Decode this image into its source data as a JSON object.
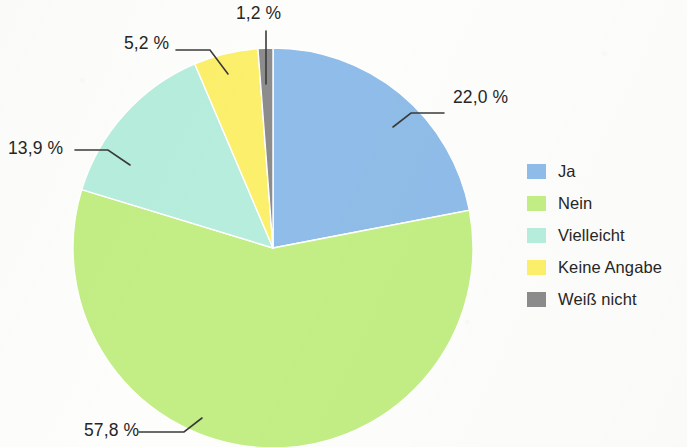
{
  "chart_data": {
    "type": "pie",
    "title": "",
    "subtitle": "",
    "xlabel": "",
    "ylabel": "",
    "legend_position": "right",
    "grid": false,
    "start_angle_deg": 0,
    "direction": "clockwise",
    "categories": [
      "Ja",
      "Nein",
      "Vielleicht",
      "Keine Angabe",
      "Weiß nicht"
    ],
    "values": [
      22.0,
      57.8,
      13.9,
      5.2,
      1.2
    ],
    "value_labels": [
      "22,0 %",
      "57,8 %",
      "13,9 %",
      "5,2 %",
      "1,2 %"
    ],
    "colors": [
      "#8FBCE8",
      "#C3EE85",
      "#B6EDDC",
      "#FCEF6B",
      "#8C8C8C"
    ],
    "unit": "%",
    "slices": [
      {
        "label": "Ja",
        "value": 22.0,
        "value_label": "22,0 %",
        "color": "#8FBCE8"
      },
      {
        "label": "Nein",
        "value": 57.8,
        "value_label": "57,8 %",
        "color": "#C3EE85"
      },
      {
        "label": "Vielleicht",
        "value": 13.9,
        "value_label": "13,9 %",
        "color": "#B6EDDC"
      },
      {
        "label": "Keine Angabe",
        "value": 5.2,
        "value_label": "5,2 %",
        "color": "#FCEF6B"
      },
      {
        "label": "Weiß nicht",
        "value": 1.2,
        "value_label": "1,2 %",
        "color": "#8C8C8C"
      }
    ]
  },
  "legend": {
    "items": [
      {
        "label": "Ja",
        "color": "#8FBCE8"
      },
      {
        "label": "Nein",
        "color": "#C3EE85"
      },
      {
        "label": "Vielleicht",
        "color": "#B6EDDC"
      },
      {
        "label": "Keine Angabe",
        "color": "#FCEF6B"
      },
      {
        "label": "Weiß nicht",
        "color": "#8C8C8C"
      }
    ]
  },
  "callouts": [
    {
      "text": "22,0 %",
      "slice": "Ja"
    },
    {
      "text": "57,8 %",
      "slice": "Nein"
    },
    {
      "text": "13,9 %",
      "slice": "Vielleicht"
    },
    {
      "text": "5,2 %",
      "slice": "Keine Angabe"
    },
    {
      "text": "1,2 %",
      "slice": "Weiß nicht"
    }
  ]
}
